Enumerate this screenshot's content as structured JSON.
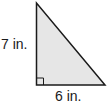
{
  "figure": {
    "type": "right-triangle",
    "fill_color": "#e6e6e6",
    "stroke_color": "#1a1a1a",
    "height_label": "7 in.",
    "base_label": "6 in.",
    "right_angle_marker": true
  }
}
